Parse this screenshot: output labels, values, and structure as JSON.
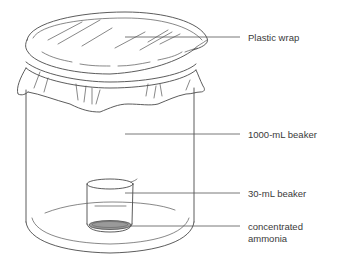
{
  "diagram": {
    "title": "",
    "labels": {
      "plastic_wrap": "Plastic wrap",
      "large_beaker": "1000-mL beaker",
      "small_beaker": "30-mL beaker",
      "ammonia_line1": "concentrated",
      "ammonia_line2": "ammonia"
    },
    "colors": {
      "line": "#4a4a4a",
      "text": "#3a3a3a",
      "liquid_fill": "#9a9a9a",
      "background": "#ffffff"
    }
  }
}
